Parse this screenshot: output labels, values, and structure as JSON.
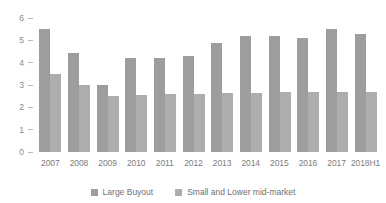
{
  "chart_data": {
    "type": "bar",
    "title": "",
    "subtitle": "",
    "xlabel": "",
    "ylabel": "",
    "ylim": [
      0,
      6
    ],
    "yticks": [
      0,
      1,
      2,
      3,
      4,
      5,
      6
    ],
    "ytick_labels": [
      "0",
      "1",
      "2",
      "3",
      "4",
      "5",
      "6"
    ],
    "grid": false,
    "legend_position": "bottom-center",
    "categories": [
      "2007",
      "2008",
      "2009",
      "2010",
      "2011",
      "2012",
      "2013",
      "2014",
      "2015",
      "2016",
      "2017",
      "2018H1"
    ],
    "series": [
      {
        "name": "Large Buyout",
        "color": "#9d9d9d",
        "values": [
          5.5,
          4.45,
          3.0,
          4.2,
          4.2,
          4.3,
          4.9,
          5.2,
          5.2,
          5.1,
          5.5,
          5.3
        ]
      },
      {
        "name": "Small and Lower mid-market",
        "color": "#adadad",
        "values": [
          3.5,
          3.0,
          2.5,
          2.55,
          2.6,
          2.6,
          2.65,
          2.65,
          2.7,
          2.7,
          2.7,
          2.7
        ]
      }
    ]
  },
  "axis": {
    "tick_dash": "–"
  }
}
